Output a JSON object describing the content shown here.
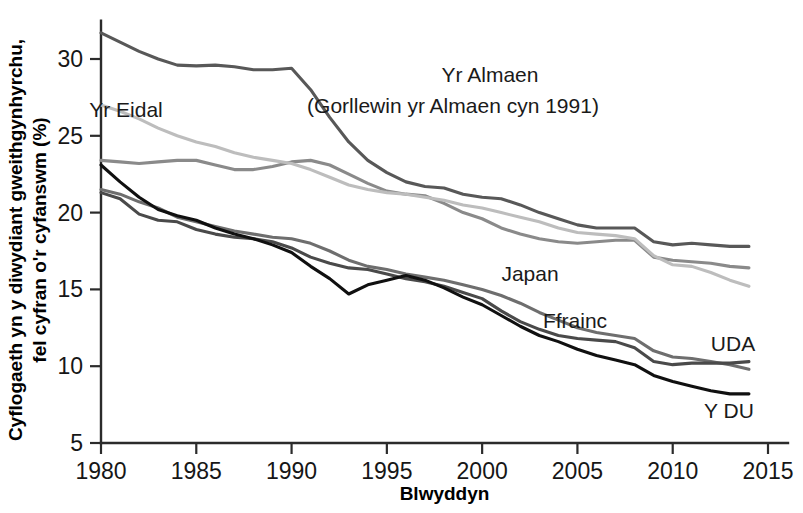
{
  "chart_data": {
    "type": "line",
    "title": "",
    "xlabel": "Blwyddyn",
    "ylabel": "Cyflogaeth yn y diwydiant gweithgynhyrchu, fel cyfran o'r cyfanswm (%)",
    "xlim": [
      1980,
      2015
    ],
    "ylim": [
      5,
      32.5
    ],
    "xticks": [
      1980,
      1985,
      1990,
      1995,
      2000,
      2005,
      2010,
      2015
    ],
    "yticks": [
      5,
      10,
      15,
      20,
      25,
      30
    ],
    "grid": false,
    "legend_position": "inline-annotations",
    "x": [
      1980,
      1981,
      1982,
      1983,
      1984,
      1985,
      1986,
      1987,
      1988,
      1989,
      1990,
      1991,
      1992,
      1993,
      1994,
      1995,
      1996,
      1997,
      1998,
      1999,
      2000,
      2001,
      2002,
      2003,
      2004,
      2005,
      2006,
      2007,
      2008,
      2009,
      2010,
      2011,
      2012,
      2013,
      2014
    ],
    "series": [
      {
        "name": "Yr Almaen",
        "label": "Yr Almaen",
        "sublabel": "(Gorllewin yr Almaen cyn 1991)",
        "color": "#585858",
        "values": [
          31.7,
          31.1,
          30.5,
          30.0,
          29.6,
          29.55,
          29.6,
          29.5,
          29.3,
          29.3,
          29.4,
          28.0,
          26.2,
          24.6,
          23.4,
          22.6,
          22.0,
          21.7,
          21.6,
          21.2,
          21.0,
          20.9,
          20.5,
          20.0,
          19.6,
          19.2,
          19.0,
          19.0,
          19.0,
          18.1,
          17.9,
          18.0,
          17.9,
          17.8,
          17.8
        ]
      },
      {
        "name": "Japan",
        "label": "Japan",
        "color": "#8a8a8a",
        "values": [
          23.4,
          23.3,
          23.2,
          23.3,
          23.4,
          23.4,
          23.1,
          22.8,
          22.8,
          23.0,
          23.3,
          23.4,
          23.1,
          22.5,
          21.9,
          21.4,
          21.2,
          21.1,
          20.6,
          20.0,
          19.6,
          19.0,
          18.6,
          18.3,
          18.1,
          18.0,
          18.1,
          18.2,
          18.2,
          17.1,
          16.9,
          16.8,
          16.7,
          16.5,
          16.4
        ]
      },
      {
        "name": "Yr Eidal",
        "label": "Yr Eidal",
        "color": "#bdbdbd",
        "values": [
          27.0,
          26.6,
          26.1,
          25.5,
          25.0,
          24.6,
          24.3,
          23.9,
          23.6,
          23.4,
          23.2,
          22.8,
          22.3,
          21.8,
          21.5,
          21.3,
          21.2,
          21.0,
          20.8,
          20.5,
          20.3,
          20.0,
          19.7,
          19.4,
          19.0,
          18.7,
          18.6,
          18.5,
          18.3,
          17.2,
          16.6,
          16.5,
          16.1,
          15.6,
          15.2
        ]
      },
      {
        "name": "Ffrainc",
        "label": "Ffrainc",
        "color": "#6e6e6e",
        "values": [
          21.5,
          21.2,
          20.7,
          20.3,
          19.7,
          19.4,
          19.1,
          18.8,
          18.6,
          18.4,
          18.3,
          18.0,
          17.5,
          16.9,
          16.5,
          16.3,
          16.0,
          15.8,
          15.6,
          15.3,
          15.0,
          14.6,
          14.1,
          13.5,
          13.0,
          12.5,
          12.2,
          12.0,
          11.8,
          11.0,
          10.6,
          10.5,
          10.3,
          10.1,
          9.8
        ]
      },
      {
        "name": "UDA",
        "label": "UDA",
        "color": "#4a4a4a",
        "values": [
          21.3,
          20.9,
          19.9,
          19.5,
          19.4,
          18.9,
          18.6,
          18.4,
          18.3,
          18.1,
          17.7,
          17.1,
          16.7,
          16.4,
          16.3,
          16.0,
          15.7,
          15.5,
          15.2,
          14.8,
          14.4,
          13.6,
          12.9,
          12.4,
          12.0,
          11.8,
          11.7,
          11.6,
          11.2,
          10.3,
          10.1,
          10.2,
          10.2,
          10.2,
          10.3
        ]
      },
      {
        "name": "Y DU",
        "label": "Y DU",
        "color": "#101010",
        "values": [
          23.1,
          22.0,
          21.0,
          20.2,
          19.8,
          19.5,
          19.0,
          18.6,
          18.3,
          17.9,
          17.4,
          16.5,
          15.7,
          14.7,
          15.3,
          15.6,
          15.9,
          15.6,
          15.1,
          14.5,
          14.0,
          13.3,
          12.6,
          12.0,
          11.6,
          11.1,
          10.7,
          10.4,
          10.1,
          9.4,
          9.0,
          8.7,
          8.4,
          8.2,
          8.2
        ]
      }
    ],
    "annotations": [
      {
        "key": "germany",
        "text": "Yr Almaen",
        "x": 490,
        "y": 82
      },
      {
        "key": "germany2",
        "text": "(Gorllewin yr Almaen cyn 1991)",
        "x": 453,
        "y": 113
      },
      {
        "key": "italy",
        "text": "Yr Eidal",
        "x": 126,
        "y": 117
      },
      {
        "key": "japan",
        "text": "Japan",
        "x": 530,
        "y": 281
      },
      {
        "key": "france",
        "text": "Ffrainc",
        "x": 575,
        "y": 328
      },
      {
        "key": "usa",
        "text": "UDA",
        "x": 733,
        "y": 351
      },
      {
        "key": "uk",
        "text": "Y DU",
        "x": 729,
        "y": 418
      }
    ]
  }
}
